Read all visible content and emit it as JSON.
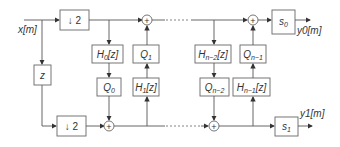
{
  "diagram": {
    "type": "lifting-scheme filterbank block diagram",
    "input_label": "x[m]",
    "outputs": [
      {
        "label": "y0[m]",
        "scale_block": "s0"
      },
      {
        "label": "y1[m]",
        "scale_block": "s1"
      }
    ],
    "blocks": {
      "downsample_top": "↓2",
      "downsample_bottom": "↓2",
      "delay": "z",
      "h0": "H0[z]",
      "q0": "Q0",
      "q1": "Q1",
      "h1": "H1[z]",
      "hn2": "Hn−2[z]",
      "qn2": "Qn−2",
      "qn1": "Qn−1",
      "hn1": "Hn−1[z]",
      "s0": "s0",
      "s1": "s1"
    },
    "adder_symbol": "+",
    "continuation": "⋯"
  }
}
